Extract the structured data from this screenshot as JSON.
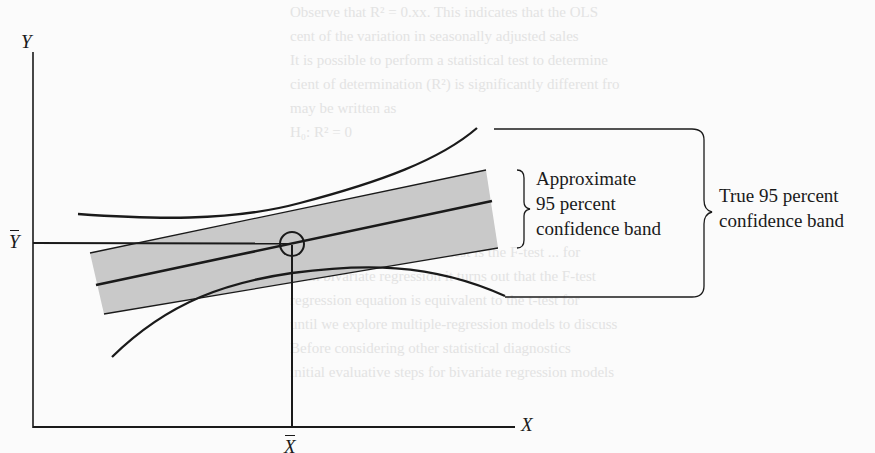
{
  "figure": {
    "type": "confidence-band-diagram",
    "axes": {
      "y_label": "Y",
      "x_label": "X",
      "y_mean_label": "Y",
      "x_mean_label": "X",
      "y_mean_has_bar": true,
      "x_mean_has_bar": true
    },
    "annotations": {
      "approximate_band": {
        "line1": "Approximate",
        "line2": "95 percent",
        "line3": "confidence band"
      },
      "true_band": {
        "line1": "True 95 percent",
        "line2": "confidence band"
      }
    },
    "elements": [
      "regression-line",
      "approximate-confidence-band-shaded",
      "true-confidence-band-curves",
      "mean-point-circle",
      "mean-guide-lines"
    ],
    "colors": {
      "ink": "#1a1a1a",
      "band_fill": "#c9c9c9",
      "background": "#fbfbfb",
      "bleed_through_text": "#e3e3e3"
    }
  },
  "background_text": {
    "lines": [
      "Observe that R² = 0.xx. This indicates that the OLS",
      "cent of the variation in seasonally adjusted sales",
      "It is possible to perform a statistical test to determine",
      "cient of determination (R²) is significantly different from",
      "may be written as",
      "",
      "H₀: R² = 0",
      "",
      "",
      "",
      "",
      "The appropriate statistical test is the F-test ... for",
      "With bivariate regression it turns out that the F-test",
      "regression equation is equivalent to the t-test for",
      "until we explore multiple-regression models to discuss",
      "Before considering other statistical diagnostics",
      "initial evaluative steps for bivariate regression models"
    ]
  }
}
